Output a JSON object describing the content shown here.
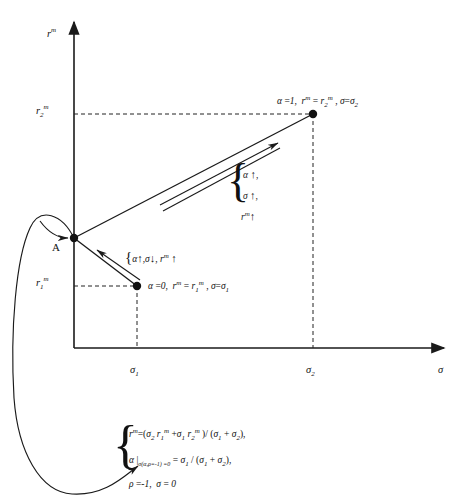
{
  "figure": {
    "axes": {
      "y_axis_label": "r",
      "y_axis_label_sup": "m",
      "x_axis_label": "σ",
      "y_ticks": [
        {
          "base": "r",
          "sub": "2",
          "sup": "m"
        },
        {
          "base": "r",
          "sub": "1",
          "sup": "m"
        }
      ],
      "x_ticks": [
        {
          "base": "σ",
          "sub": "1"
        },
        {
          "base": "σ",
          "sub": "2"
        }
      ]
    },
    "points": {
      "a_label": "A",
      "upper_right_label": "α =1,  rᵐ = r₂ᵐ , σ=σ₂",
      "lower_label": "α =0,  rᵐ = r₁ᵐ , σ=σ₁"
    },
    "annotations": {
      "upper_brace": {
        "lines": [
          {
            "symbol": "α",
            "arrow": "↑",
            "trail": ","
          },
          {
            "symbol": "σ",
            "arrow": "↑",
            "trail": ","
          },
          {
            "symbol": "rᵐ",
            "arrow": "↑",
            "trail": ""
          }
        ]
      },
      "lower_inline": {
        "open": "{",
        "items": [
          {
            "symbol": "α",
            "arrow": "↑",
            "trail": ","
          },
          {
            "symbol": "σ",
            "arrow": "↓",
            "trail": ","
          },
          {
            "symbol": "rᵐ",
            "arrow": "↑",
            "trail": ""
          }
        ]
      }
    },
    "formula_block": {
      "brace": "{",
      "lines": [
        "rᵐ =(σ₂ r₁ᵐ + σ₁ r₂ᵐ )/ (σ₁ + σ₂),",
        "α |σ(α,ρ=-1) =0 = σ₁ / (σ₁ + σ₂),",
        "ρ =-1,   σ = 0"
      ]
    },
    "colors": {
      "ink": "#1a1a1a",
      "line": "#222222",
      "dash": "#333333"
    }
  }
}
